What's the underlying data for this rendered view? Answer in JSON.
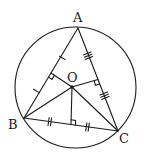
{
  "diagram": {
    "type": "geometry",
    "colors": {
      "stroke": "#1a1a1a",
      "background": "#ffffff"
    },
    "circle": {
      "cx": 75.5,
      "cy": 87.5,
      "r": 60.5
    },
    "points": {
      "A": {
        "label": "A",
        "x": 78,
        "y": 28
      },
      "B": {
        "label": "B",
        "x": 24,
        "y": 118
      },
      "C": {
        "label": "C",
        "x": 118,
        "y": 131
      },
      "O": {
        "label": "O",
        "x": 72,
        "y": 87
      }
    },
    "sides": [
      {
        "from": "A",
        "to": "B",
        "tick_marks": 1
      },
      {
        "from": "A",
        "to": "C",
        "tick_marks": 3
      },
      {
        "from": "B",
        "to": "C",
        "tick_marks": 2
      }
    ],
    "segments_from_O": [
      "A",
      "B",
      "C"
    ],
    "perpendiculars": [
      {
        "from": "O",
        "to_side": "AB",
        "right_angle": true
      },
      {
        "from": "O",
        "to_side": "AC",
        "right_angle": true
      },
      {
        "from": "O",
        "to_side": "BC",
        "right_angle": true
      }
    ]
  }
}
